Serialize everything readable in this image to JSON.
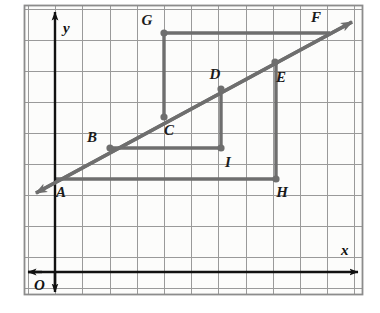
{
  "figure": {
    "kind": "coordinate-plane-geometry-diagram",
    "canvas": {
      "width": 380,
      "height": 313
    },
    "frame": {
      "x": 24,
      "y": 5,
      "width": 339,
      "height": 290,
      "color": "#8c8c8c"
    },
    "background_color": "#fdfdfc",
    "grid": {
      "color": "#9a9a9a",
      "x_start": 28,
      "x_spacing": 27.2,
      "x_count": 13,
      "y_start": 9,
      "y_spacing": 31.0,
      "y_count": 10,
      "visible": true
    },
    "axes": {
      "color": "#111111",
      "x_axis": {
        "label": "x",
        "y": 272,
        "x_from": 28,
        "x_to": 358,
        "arrow_left": true,
        "arrow_right": true
      },
      "y_axis": {
        "label": "y",
        "x": 55,
        "y_from": 290,
        "y_to": 12,
        "arrow_up": true,
        "arrow_down": true
      },
      "origin_label": "O"
    },
    "line_color": "#6e6e6e",
    "points": [
      {
        "name": "A",
        "x": 55,
        "y": 179,
        "label_dx": 6,
        "label_dy": 18,
        "dot": false
      },
      {
        "name": "B",
        "x": 110,
        "y": 148,
        "label_dx": -18,
        "label_dy": -6,
        "dot": true
      },
      {
        "name": "C",
        "x": 164,
        "y": 117,
        "label_dx": 5,
        "label_dy": 18,
        "dot": true
      },
      {
        "name": "D",
        "x": 221,
        "y": 89,
        "label_dx": -6,
        "label_dy": -10,
        "dot": true
      },
      {
        "name": "E",
        "x": 275,
        "y": 62,
        "label_dx": 6,
        "label_dy": 20,
        "dot": true
      },
      {
        "name": "F",
        "x": 330,
        "y": 33,
        "label_dx": -14,
        "label_dy": -11,
        "dot": false
      },
      {
        "name": "G",
        "x": 164,
        "y": 33,
        "label_dx": -17,
        "label_dy": -8,
        "dot": true
      },
      {
        "name": "H",
        "x": 276,
        "y": 179,
        "label_dx": 6,
        "label_dy": 18,
        "dot": true
      },
      {
        "name": "I",
        "x": 221,
        "y": 148,
        "label_dx": 7,
        "label_dy": 19,
        "dot": true
      }
    ],
    "ray": {
      "name": "diagonal-ray-AF",
      "from": {
        "x": 36,
        "y": 193
      },
      "to": {
        "x": 352,
        "y": 22
      },
      "arrow_start": true,
      "arrow_end": true,
      "through": [
        "A",
        "B",
        "C",
        "D",
        "E",
        "F"
      ]
    },
    "paths": [
      {
        "name": "segment-path-G-F",
        "points": [
          [
            164,
            33
          ],
          [
            330,
            33
          ]
        ],
        "note": "horizontal from G to F"
      },
      {
        "name": "segment-path-C-G",
        "points": [
          [
            164,
            117
          ],
          [
            164,
            33
          ]
        ],
        "note": "vertical from C up to G"
      },
      {
        "name": "segment-path-B-I",
        "points": [
          [
            110,
            148
          ],
          [
            221,
            148
          ]
        ],
        "note": "horizontal from B to I"
      },
      {
        "name": "segment-path-I-D",
        "points": [
          [
            221,
            148
          ],
          [
            221,
            89
          ]
        ],
        "note": "vertical from I up to D"
      },
      {
        "name": "segment-path-A-H",
        "points": [
          [
            55,
            179
          ],
          [
            276,
            179
          ]
        ],
        "note": "horizontal from A to H"
      },
      {
        "name": "segment-path-H-E",
        "points": [
          [
            276,
            179
          ],
          [
            276,
            62
          ]
        ],
        "note": "vertical from H up to E"
      }
    ]
  },
  "chart_data": {
    "type": "scatter",
    "title": "",
    "xlabel": "x",
    "ylabel": "y",
    "grid": true,
    "legend": null,
    "annotations": [
      "O"
    ],
    "series": [
      {
        "name": "line AF points",
        "labels": [
          "A",
          "B",
          "C",
          "D",
          "E",
          "F"
        ],
        "x": [
          0,
          2,
          4,
          6,
          8,
          10
        ],
        "y": [
          3,
          4,
          5,
          6,
          7,
          8
        ]
      },
      {
        "name": "construction points",
        "labels": [
          "G",
          "H",
          "I"
        ],
        "x": [
          4,
          8,
          6
        ],
        "y": [
          8,
          3,
          4
        ]
      }
    ]
  }
}
